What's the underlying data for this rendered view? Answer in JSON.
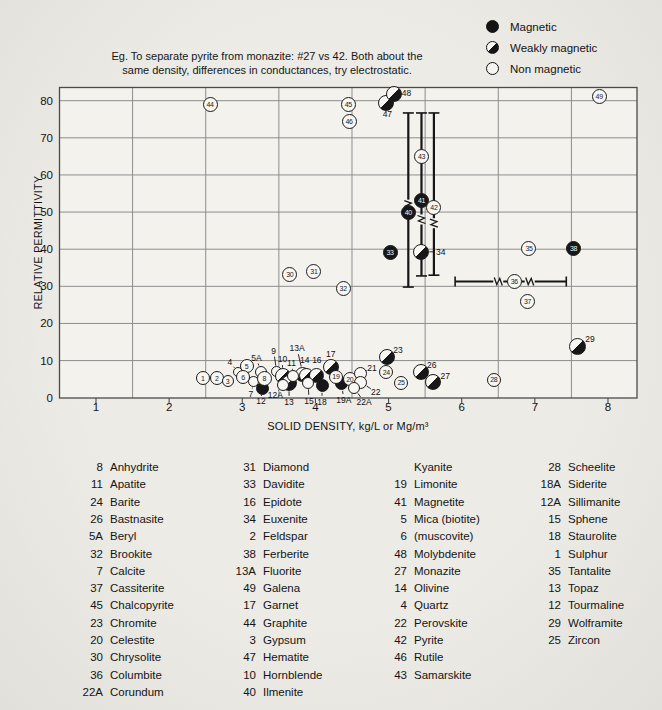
{
  "note": {
    "line1": "Eg. To separate pyrite from monazite: #27 vs 42. Both about the",
    "line2": "same density, differences in conductances, try electrostatic."
  },
  "legend": {
    "items": [
      {
        "label": "Magnetic",
        "type": "f"
      },
      {
        "label": "Weakly magnetic",
        "type": "w"
      },
      {
        "label": "Non magnetic",
        "type": "n"
      }
    ]
  },
  "axes": {
    "x_title": "SOLID DENSITY, kg/L or Mg/m³",
    "y_title": "RELATIVE PERMITTIVITY",
    "x_ticks": [
      1,
      2,
      3,
      4,
      5,
      6,
      7,
      8
    ],
    "y_ticks": [
      0,
      10,
      20,
      30,
      40,
      50,
      60,
      70,
      80
    ]
  },
  "colors": {
    "paper": "#e9e7e2",
    "plot_fill": "#f3f2ed",
    "grid": "#8d8d8d",
    "border": "#4a4a4a",
    "ink": "#1a1a1a"
  },
  "chart_data": {
    "type": "scatter",
    "xlabel": "SOLID DENSITY, kg/L or Mg/m3",
    "ylabel": "RELATIVE PERMITTIVITY",
    "xlim": [
      0.5,
      8.45
    ],
    "ylim": [
      0,
      83.5
    ],
    "x_gridlines": [
      1.5,
      2.5,
      3.5,
      4.5,
      5.5,
      6.5,
      7.5
    ],
    "y_gridlines": [
      10,
      20,
      30,
      40,
      50,
      60,
      70,
      80
    ],
    "legend_position": "top-right",
    "magnetism_key": {
      "f": "Magnetic",
      "w": "Weakly magnetic",
      "n": "Non magnetic"
    },
    "points": [
      {
        "n": "9",
        "x": 3.47,
        "y": 7.0,
        "m": "n",
        "lab": "out",
        "r": 5.5,
        "dx": -3,
        "dy": -21,
        "leader": true
      },
      {
        "n": "10",
        "x": 3.55,
        "y": 5.8,
        "m": "w",
        "lab": "out",
        "r": 8,
        "dx": 0,
        "dy": -17,
        "leader": true
      },
      {
        "n": "13",
        "x": 3.64,
        "y": 4.0,
        "m": "w",
        "lab": "out",
        "r": 8,
        "dx": 0,
        "dy": 19,
        "leader": true
      },
      {
        "n": "13A",
        "x": 3.83,
        "y": 6.3,
        "m": "w",
        "lab": "out",
        "r": 7.5,
        "dx": -6,
        "dy": -26,
        "leader": true
      },
      {
        "n": "14",
        "x": 3.88,
        "y": 6.1,
        "m": "w",
        "lab": "out",
        "r": 7.5,
        "dx": -2,
        "dy": -15,
        "leader": false
      },
      {
        "n": "16",
        "x": 4.02,
        "y": 6.1,
        "m": "w",
        "lab": "out",
        "r": 7.5,
        "dx": 0,
        "dy": -15,
        "leader": false
      },
      {
        "n": "17",
        "x": 4.21,
        "y": 8.3,
        "m": "w",
        "lab": "out",
        "r": 8,
        "dx": 0,
        "dy": -13,
        "leader": false
      },
      {
        "n": "12",
        "x": 3.27,
        "y": 2.6,
        "m": "f",
        "lab": "out",
        "r": 6.5,
        "dx": -1,
        "dy": 13,
        "leader": true
      },
      {
        "n": "18",
        "x": 4.09,
        "y": 3.2,
        "m": "f",
        "lab": "out",
        "r": 6.5,
        "dx": 0,
        "dy": 16,
        "leader": true
      },
      {
        "n": "19A",
        "x": 4.36,
        "y": 3.7,
        "m": "f",
        "lab": "out",
        "r": 6.5,
        "dx": 2,
        "dy": 16,
        "leader": true
      },
      {
        "n": "11",
        "x": 3.7,
        "y": 5.8,
        "m": "n",
        "lab": "out",
        "r": 6,
        "dx": -2,
        "dy": -13,
        "leader": true
      },
      {
        "n": "12A",
        "x": 3.56,
        "y": 3.5,
        "m": "n",
        "lab": "out",
        "r": 6,
        "dx": -8,
        "dy": 10,
        "leader": true
      },
      {
        "n": "15",
        "x": 3.9,
        "y": 4.0,
        "m": "n",
        "lab": "out",
        "r": 6,
        "dx": 1,
        "dy": 18,
        "leader": true
      },
      {
        "n": "4",
        "x": 2.94,
        "y": 6.9,
        "m": "n",
        "lab": "out",
        "r": 5,
        "dx": -8,
        "dy": -10,
        "leader": true
      },
      {
        "n": "5A",
        "x": 3.25,
        "y": 7.0,
        "m": "n",
        "lab": "out",
        "r": 6,
        "dx": -4,
        "dy": -14,
        "leader": true
      },
      {
        "n": "7",
        "x": 3.16,
        "y": 4.3,
        "m": "n",
        "lab": "out",
        "r": 5.5,
        "dx": -3,
        "dy": 12,
        "leader": true
      },
      {
        "n": "1",
        "x": 2.46,
        "y": 5.3,
        "m": "n",
        "lab": "in",
        "r": 7
      },
      {
        "n": "2",
        "x": 2.65,
        "y": 5.3,
        "m": "n",
        "lab": "in",
        "r": 7
      },
      {
        "n": "3",
        "x": 2.8,
        "y": 4.4,
        "m": "n",
        "lab": "in",
        "r": 6
      },
      {
        "n": "5",
        "x": 3.06,
        "y": 8.5,
        "m": "n",
        "lab": "in",
        "r": 7
      },
      {
        "n": "6",
        "x": 3.01,
        "y": 5.5,
        "m": "n",
        "lab": "in",
        "r": 7
      },
      {
        "n": "8",
        "x": 3.3,
        "y": 5.3,
        "m": "n",
        "lab": "in",
        "r": 7.5
      },
      {
        "n": "19",
        "x": 4.28,
        "y": 5.6,
        "m": "n",
        "lab": "in",
        "r": 7
      },
      {
        "n": "20",
        "x": 4.47,
        "y": 5.0,
        "m": "n",
        "lab": "in",
        "r": 7
      },
      {
        "n": "21",
        "x": 4.61,
        "y": 6.4,
        "m": "n",
        "lab": "out",
        "r": 6.5,
        "dx": 12,
        "dy": -6,
        "leader": true
      },
      {
        "n": "22",
        "x": 4.62,
        "y": 4.2,
        "m": "n",
        "lab": "out",
        "r": 6.5,
        "dx": 15,
        "dy": 10,
        "leader": true
      },
      {
        "n": "22A",
        "x": 4.53,
        "y": 2.6,
        "m": "n",
        "lab": "out",
        "r": 6,
        "dx": 10,
        "dy": 14,
        "leader": true
      },
      {
        "n": "23",
        "x": 4.98,
        "y": 11.0,
        "m": "w",
        "lab": "out",
        "r": 8,
        "dx": 11,
        "dy": -7,
        "leader": false
      },
      {
        "n": "24",
        "x": 4.97,
        "y": 6.9,
        "m": "n",
        "lab": "in",
        "r": 7
      },
      {
        "n": "25",
        "x": 5.17,
        "y": 4.0,
        "m": "n",
        "lab": "in",
        "r": 7
      },
      {
        "n": "26",
        "x": 5.44,
        "y": 6.9,
        "m": "w",
        "lab": "out",
        "r": 8,
        "dx": 11,
        "dy": -7,
        "leader": false
      },
      {
        "n": "27",
        "x": 5.61,
        "y": 4.2,
        "m": "w",
        "lab": "out",
        "r": 8,
        "dx": 12,
        "dy": -6,
        "leader": false
      },
      {
        "n": "28",
        "x": 6.44,
        "y": 4.8,
        "m": "n",
        "lab": "in",
        "r": 7
      },
      {
        "n": "29",
        "x": 7.59,
        "y": 13.7,
        "m": "w",
        "lab": "out",
        "r": 8.5,
        "dx": 12,
        "dy": -8,
        "leader": false
      },
      {
        "n": "30",
        "x": 3.65,
        "y": 33.3,
        "m": "n",
        "lab": "in",
        "r": 7.5
      },
      {
        "n": "31",
        "x": 3.98,
        "y": 34.1,
        "m": "n",
        "lab": "in",
        "r": 7.5
      },
      {
        "n": "32",
        "x": 4.38,
        "y": 29.3,
        "m": "n",
        "lab": "in",
        "r": 7.5
      },
      {
        "n": "33",
        "x": 5.02,
        "y": 39.0,
        "m": "f",
        "lab": "in",
        "r": 7.5
      },
      {
        "n": "34",
        "x": 5.44,
        "y": 39.3,
        "m": "w",
        "lab": "out",
        "r": 8,
        "dx": 20,
        "dy": 0,
        "leader": true
      },
      {
        "n": "35",
        "x": 6.92,
        "y": 40.3,
        "m": "n",
        "lab": "in",
        "r": 7.5
      },
      {
        "n": "36",
        "x": 6.72,
        "y": 31.2,
        "m": "n",
        "lab": "in",
        "r": 7.5
      },
      {
        "n": "37",
        "x": 6.9,
        "y": 26.0,
        "m": "n",
        "lab": "in",
        "r": 7.5
      },
      {
        "n": "38",
        "x": 7.53,
        "y": 40.1,
        "m": "f",
        "lab": "in",
        "r": 7.5
      },
      {
        "n": "40",
        "x": 5.27,
        "y": 50.0,
        "m": "f",
        "lab": "in",
        "r": 7.5
      },
      {
        "n": "41",
        "x": 5.45,
        "y": 53.0,
        "m": "f",
        "lab": "in",
        "r": 7.5
      },
      {
        "n": "42",
        "x": 5.62,
        "y": 51.1,
        "m": "n",
        "lab": "in",
        "r": 7.5
      },
      {
        "n": "43",
        "x": 5.45,
        "y": 65.1,
        "m": "n",
        "lab": "in",
        "r": 7.5
      },
      {
        "n": "44",
        "x": 2.56,
        "y": 79.1,
        "m": "n",
        "lab": "in",
        "r": 7.5
      },
      {
        "n": "45",
        "x": 4.45,
        "y": 79.1,
        "m": "n",
        "lab": "in",
        "r": 7.5
      },
      {
        "n": "46",
        "x": 4.46,
        "y": 74.5,
        "m": "n",
        "lab": "in",
        "r": 7.5
      },
      {
        "n": "47",
        "x": 4.97,
        "y": 79.4,
        "m": "w",
        "lab": "out",
        "r": 8,
        "dx": 1,
        "dy": 11,
        "leader": false
      },
      {
        "n": "48",
        "x": 5.08,
        "y": 81.8,
        "m": "w",
        "lab": "out",
        "r": 8,
        "dx": 12,
        "dy": -1,
        "leader": false
      },
      {
        "n": "49",
        "x": 7.88,
        "y": 81.0,
        "m": "n",
        "lab": "in",
        "r": 7.5
      }
    ],
    "error_bars": [
      {
        "dir": "v",
        "x": 5.27,
        "y1": 29.8,
        "y2": 76.7,
        "breaks": [
          52
        ]
      },
      {
        "dir": "v",
        "x": 5.45,
        "y1": 32.8,
        "y2": 76.7,
        "breaks": [
          48
        ]
      },
      {
        "dir": "v",
        "x": 5.62,
        "y1": 33.0,
        "y2": 76.7,
        "breaks": [
          47
        ]
      },
      {
        "dir": "h",
        "y": 31.3,
        "x1": 5.91,
        "x2": 7.43,
        "breaks": [
          6.5,
          6.93
        ]
      }
    ]
  },
  "minerals": {
    "columns": [
      [
        {
          "n": "8",
          "name": "Anhydrite"
        },
        {
          "n": "11",
          "name": "Apatite"
        },
        {
          "n": "24",
          "name": "Barite"
        },
        {
          "n": "26",
          "name": "Bastnasite"
        },
        {
          "n": "5A",
          "name": "Beryl"
        },
        {
          "n": "32",
          "name": "Brookite"
        },
        {
          "n": "7",
          "name": "Calcite"
        },
        {
          "n": "37",
          "name": "Cassiterite"
        },
        {
          "n": "45",
          "name": "Chalcopyrite"
        },
        {
          "n": "23",
          "name": "Chromite"
        },
        {
          "n": "20",
          "name": "Celestite"
        },
        {
          "n": "30",
          "name": "Chrysolite"
        },
        {
          "n": "36",
          "name": "Columbite"
        },
        {
          "n": "22A",
          "name": "Corundum"
        }
      ],
      [
        {
          "n": "31",
          "name": "Diamond"
        },
        {
          "n": "33",
          "name": "Davidite"
        },
        {
          "n": "16",
          "name": "Epidote"
        },
        {
          "n": "34",
          "name": "Euxenite"
        },
        {
          "n": "2",
          "name": "Feldspar"
        },
        {
          "n": "38",
          "name": "Ferberite"
        },
        {
          "n": "13A",
          "name": "Fluorite"
        },
        {
          "n": "49",
          "name": "Galena"
        },
        {
          "n": "17",
          "name": "Garnet"
        },
        {
          "n": "44",
          "name": "Graphite"
        },
        {
          "n": "3",
          "name": "Gypsum"
        },
        {
          "n": "47",
          "name": "Hematite"
        },
        {
          "n": "10",
          "name": "Hornblende"
        },
        {
          "n": "40",
          "name": "Ilmenite"
        }
      ],
      [
        {
          "n": "",
          "name": "Kyanite"
        },
        {
          "n": "19",
          "name": "Limonite"
        },
        {
          "n": "41",
          "name": "Magnetite"
        },
        {
          "n": "5",
          "name": "Mica (biotite)"
        },
        {
          "n": "6",
          "name": "(muscovite)"
        },
        {
          "n": "48",
          "name": "Molybdenite"
        },
        {
          "n": "27",
          "name": "Monazite"
        },
        {
          "n": "14",
          "name": "Olivine"
        },
        {
          "n": "4",
          "name": "Quartz"
        },
        {
          "n": "22",
          "name": "Perovskite"
        },
        {
          "n": "42",
          "name": "Pyrite"
        },
        {
          "n": "46",
          "name": "Rutile"
        },
        {
          "n": "43",
          "name": "Samarskite"
        }
      ],
      [
        {
          "n": "28",
          "name": "Scheelite"
        },
        {
          "n": "18A",
          "name": "Siderite"
        },
        {
          "n": "12A",
          "name": "Sillimanite"
        },
        {
          "n": "15",
          "name": "Sphene"
        },
        {
          "n": "18",
          "name": "Staurolite"
        },
        {
          "n": "1",
          "name": "Sulphur"
        },
        {
          "n": "35",
          "name": "Tantalite"
        },
        {
          "n": "13",
          "name": "Topaz"
        },
        {
          "n": "12",
          "name": "Tourmaline"
        },
        {
          "n": "29",
          "name": "Wolframite"
        },
        {
          "n": "25",
          "name": "Zircon"
        }
      ]
    ]
  }
}
